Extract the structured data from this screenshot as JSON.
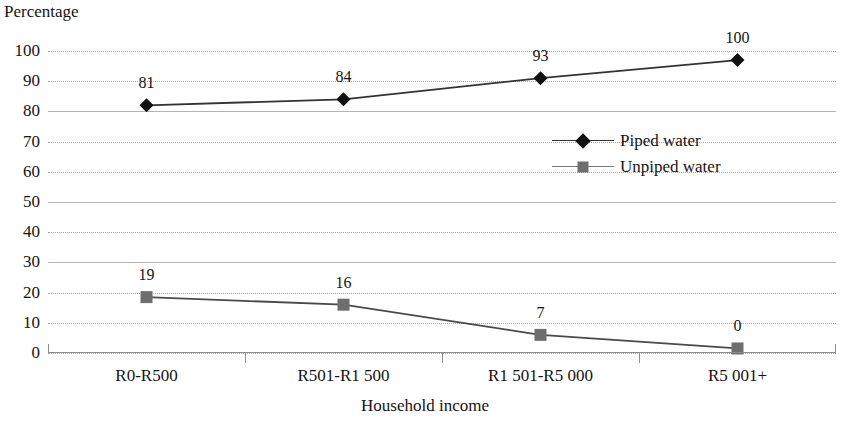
{
  "chart_data": {
    "type": "line",
    "title": "",
    "ylabel": "Percentage",
    "xlabel": "Household income",
    "categories": [
      "R0-R500",
      "R501-R1 500",
      "R1 501-R5 000",
      "R5 001+"
    ],
    "ylim": [
      0,
      100
    ],
    "ytick_step": 10,
    "yticks": [
      "100",
      "90",
      "80",
      "70",
      "60",
      "50",
      "40",
      "30",
      "20",
      "10",
      "0"
    ],
    "grid": true,
    "legend_position": "center-right",
    "series": [
      {
        "name": "Piped water",
        "values": [
          81,
          84,
          93,
          100
        ],
        "plotted": [
          82,
          84,
          91,
          97
        ],
        "labels": [
          "81",
          "84",
          "93",
          "100"
        ],
        "marker": "diamond",
        "color": "#111111",
        "line_color": "#333333"
      },
      {
        "name": "Unpiped water",
        "values": [
          19,
          16,
          7,
          0
        ],
        "plotted": [
          18.5,
          16,
          6,
          1.5
        ],
        "labels": [
          "19",
          "16",
          "7",
          "0"
        ],
        "marker": "square",
        "color": "#6e6e6e",
        "line_color": "#4a4a4a"
      }
    ]
  },
  "legend": {
    "items": [
      {
        "label": "Piped water",
        "marker": "diamond-marker",
        "color": "#111111"
      },
      {
        "label": "Unpiped water",
        "marker": "square-marker",
        "color": "#6e6e6e"
      }
    ]
  }
}
